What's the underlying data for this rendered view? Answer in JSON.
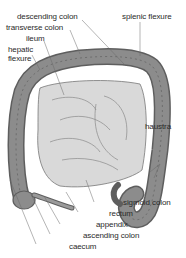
{
  "diagram": {
    "labels": {
      "descending_colon": "descending colon",
      "splenic_flexure": "splenic flexure",
      "transverse_colon": "transverse colon",
      "ileum": "ileum",
      "hepatic_flexure_1": "hepatic",
      "hepatic_flexure_2": "flexure",
      "haustra": "haustra",
      "sigmoid_colon": "sigmoid colon",
      "rectum": "rectum",
      "appendix": "appendix",
      "ascending_colon": "ascending colon",
      "caecum": "caecum"
    },
    "colors": {
      "colon_fill": "#8c8c8c",
      "colon_dark": "#5e5e5e",
      "small_intestine": "#d9d9d9",
      "leader_line": "#6a6a6a",
      "text": "#2a2a2a"
    }
  }
}
